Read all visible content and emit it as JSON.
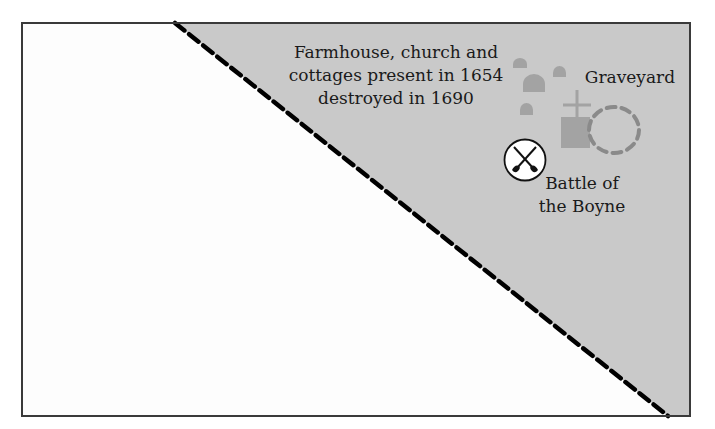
{
  "diagram": {
    "colors": {
      "frame": "#3a3a3a",
      "shaded_region": "#c9c9c9",
      "unshaded_region": "#fdfdfd",
      "boundary_line": "#000000",
      "building": "#a3a3a3",
      "graveyard_outline": "#8a8a8a",
      "battle_symbol_fill": "#ffffff",
      "battle_symbol_stroke": "#111111"
    },
    "boundary": {
      "style": "dashed",
      "start": [
        175,
        23
      ],
      "end": [
        668,
        416
      ]
    },
    "labels": {
      "settlement_line1": "Farmhouse, church and",
      "settlement_line2": "cottages present in 1654",
      "settlement_line3": "destroyed in 1690",
      "graveyard": "Graveyard",
      "battle_line1": "Battle of",
      "battle_line2": "the Boyne"
    },
    "icons": {
      "buildings": "cottage-dome-icons",
      "church": "church-with-cross-icon",
      "graveyard": "dashed-enclosure-icon",
      "battle": "crossed-swords-icon"
    }
  }
}
